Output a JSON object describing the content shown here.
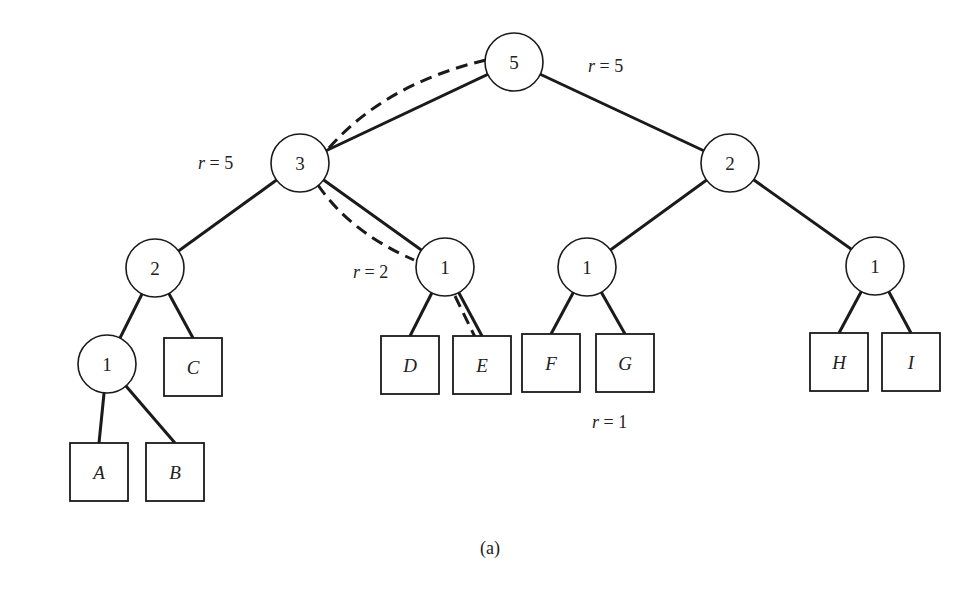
{
  "diagram": {
    "caption": "(a)",
    "nodes": [
      {
        "id": "n5",
        "label": "5",
        "x": 514,
        "y": 62
      },
      {
        "id": "n3",
        "label": "3",
        "x": 300,
        "y": 163
      },
      {
        "id": "n2r",
        "label": "2",
        "x": 730,
        "y": 163
      },
      {
        "id": "n2l",
        "label": "2",
        "x": 155,
        "y": 268
      },
      {
        "id": "n1m",
        "label": "1",
        "x": 445,
        "y": 267
      },
      {
        "id": "n1f",
        "label": "1",
        "x": 587,
        "y": 267
      },
      {
        "id": "n1h",
        "label": "1",
        "x": 875,
        "y": 266
      },
      {
        "id": "n1a",
        "label": "1",
        "x": 107,
        "y": 364
      }
    ],
    "leaves": [
      {
        "id": "A",
        "label": "A",
        "x": 70,
        "y": 443
      },
      {
        "id": "B",
        "label": "B",
        "x": 146,
        "y": 443
      },
      {
        "id": "C",
        "label": "C",
        "x": 164,
        "y": 338
      },
      {
        "id": "D",
        "label": "D",
        "x": 381,
        "y": 336
      },
      {
        "id": "E",
        "label": "E",
        "x": 453,
        "y": 336
      },
      {
        "id": "F",
        "label": "F",
        "x": 522,
        "y": 334
      },
      {
        "id": "G",
        "label": "G",
        "x": 596,
        "y": 334
      },
      {
        "id": "H",
        "label": "H",
        "x": 810,
        "y": 333
      },
      {
        "id": "I",
        "label": "I",
        "x": 882,
        "y": 333
      }
    ],
    "annotations": [
      {
        "id": "r-root",
        "var": "r",
        "eq": " = 5",
        "x": 588,
        "y": 72
      },
      {
        "id": "r-n3",
        "var": "r",
        "eq": " = 5",
        "x": 198,
        "y": 169
      },
      {
        "id": "r-n1m",
        "var": "r",
        "eq": " = 2",
        "x": 353,
        "y": 278
      },
      {
        "id": "r-leaf",
        "var": "r",
        "eq": " = 1",
        "x": 592,
        "y": 428
      }
    ],
    "edges": [
      [
        "n5",
        "n3"
      ],
      [
        "n5",
        "n2r"
      ],
      [
        "n3",
        "n2l"
      ],
      [
        "n3",
        "n1m"
      ],
      [
        "n2l",
        "n1a"
      ],
      [
        "n2l",
        "C"
      ],
      [
        "n1a",
        "A"
      ],
      [
        "n1a",
        "B"
      ],
      [
        "n1m",
        "D"
      ],
      [
        "n1m",
        "E"
      ],
      [
        "n2r",
        "n1f"
      ],
      [
        "n2r",
        "n1h"
      ],
      [
        "n1f",
        "F"
      ],
      [
        "n1f",
        "G"
      ],
      [
        "n1h",
        "H"
      ],
      [
        "n1h",
        "I"
      ]
    ],
    "dashed_path": [
      "n5",
      "n3",
      "n1m",
      "E"
    ]
  }
}
